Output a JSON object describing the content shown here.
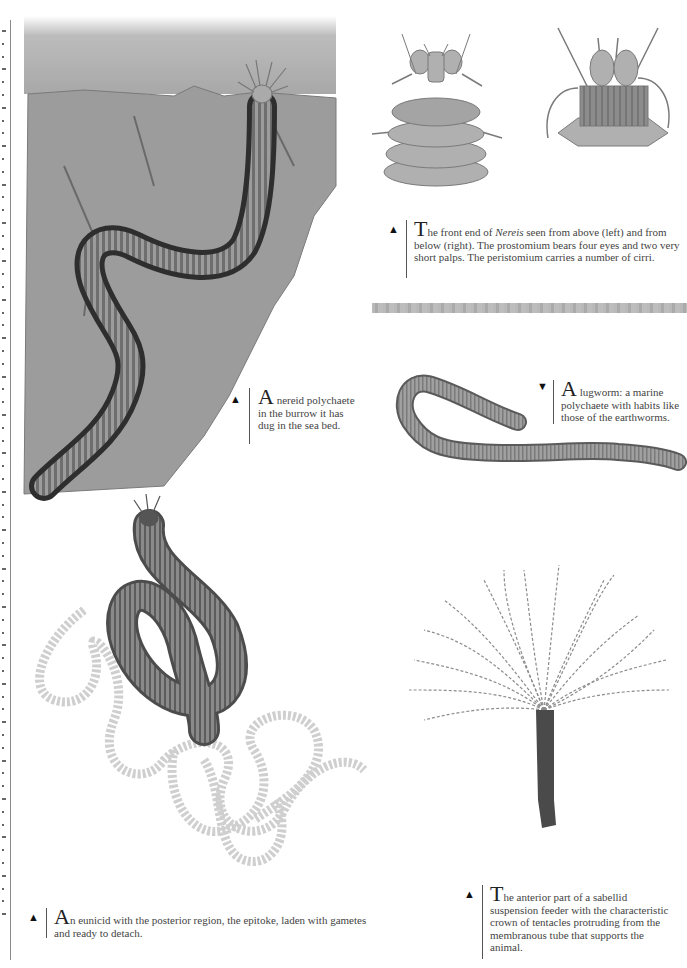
{
  "page": {
    "layout": "illustrated encyclopedia page — polychaete worms",
    "illustrations": [
      {
        "name": "nereid-burrow",
        "subject": "nereid polychaete in sea-bed burrow"
      },
      {
        "name": "nereis-front-above",
        "subject": "Nereis front end seen from above"
      },
      {
        "name": "nereis-front-below",
        "subject": "Nereis front end seen from below"
      },
      {
        "name": "lugworm",
        "subject": "lugworm"
      },
      {
        "name": "eunicid-epitoke",
        "subject": "eunicid with epitoke"
      },
      {
        "name": "sabellid-fanworm",
        "subject": "sabellid suspension feeder"
      }
    ]
  },
  "captions": {
    "nereis": {
      "marker": "▲",
      "drop": "T",
      "pre": "he front end of ",
      "italic": "Nereis",
      "post": " seen from above (left) and from below (right). The prostomium bears four eyes and two very short palps. The peristomium carries a number of cirri."
    },
    "nereid": {
      "marker": "▲",
      "drop": "A",
      "text": " nereid polychaete in the burrow it has dug in the sea bed."
    },
    "lugworm": {
      "marker": "▼",
      "drop": "A",
      "text": " lugworm: a marine polychaete with habits like those of the earthworms."
    },
    "eunicid": {
      "marker": "▲",
      "drop": "A",
      "text": "n eunicid with the posterior region, the epitoke, laden with gametes and ready to detach."
    },
    "sabellid": {
      "marker": "▲",
      "drop": "T",
      "text": "he anterior part of a sabellid suspension feeder with the characteristic crown of tentacles protruding from the membranous tube that supports the animal."
    }
  },
  "colors": {
    "text": "#444444",
    "rule": "#555555",
    "divider": "#b3b3b3",
    "worm": "#8a8a8a",
    "sediment": "#9a9a9a"
  }
}
